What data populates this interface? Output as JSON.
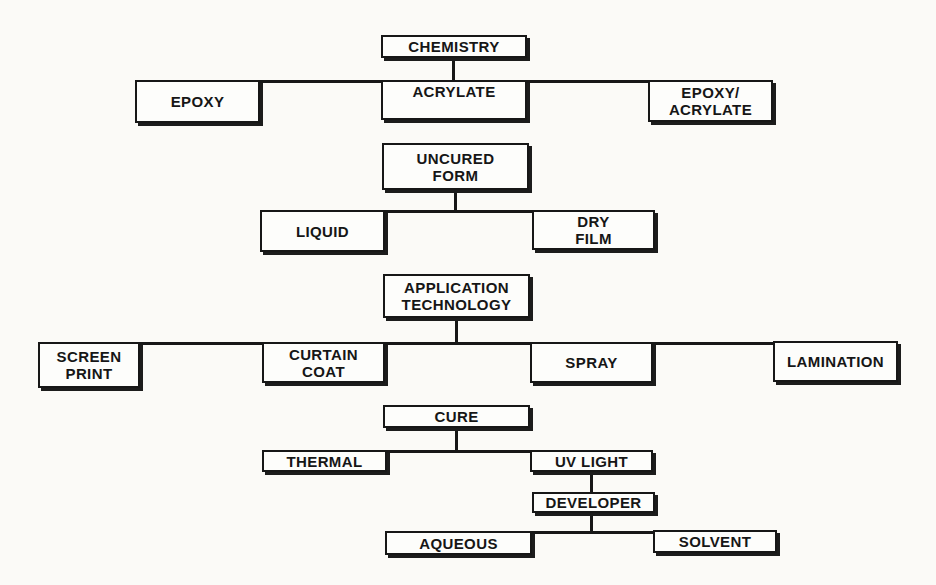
{
  "diagram": {
    "type": "tree-flowchart",
    "background_color": "#fbfaf7",
    "box_border_color": "#171717",
    "box_fill_color": "#fdfdfb",
    "line_color": "#171717",
    "nodes": [
      {
        "id": "chemistry",
        "label": "CHEMISTRY"
      },
      {
        "id": "epoxy",
        "label": "EPOXY"
      },
      {
        "id": "acrylate",
        "label": "ACRYLATE"
      },
      {
        "id": "epoxy-acrylate",
        "label": "EPOXY/\nACRYLATE"
      },
      {
        "id": "uncured-form",
        "label": "UNCURED\nFORM"
      },
      {
        "id": "liquid",
        "label": "LIQUID"
      },
      {
        "id": "dry-film",
        "label": "DRY\nFILM"
      },
      {
        "id": "application-technology",
        "label": "APPLICATION\nTECHNOLOGY"
      },
      {
        "id": "screen-print",
        "label": "SCREEN\nPRINT"
      },
      {
        "id": "curtain-coat",
        "label": "CURTAIN\nCOAT"
      },
      {
        "id": "spray",
        "label": "SPRAY"
      },
      {
        "id": "lamination",
        "label": "LAMINATION"
      },
      {
        "id": "cure",
        "label": "CURE"
      },
      {
        "id": "thermal",
        "label": "THERMAL"
      },
      {
        "id": "uv-light",
        "label": "UV LIGHT"
      },
      {
        "id": "developer",
        "label": "DEVELOPER"
      },
      {
        "id": "aqueous",
        "label": "AQUEOUS"
      },
      {
        "id": "solvent",
        "label": "SOLVENT"
      }
    ],
    "edges": [
      {
        "from": "chemistry",
        "to": [
          "epoxy",
          "acrylate",
          "epoxy-acrylate"
        ]
      },
      {
        "from": "uncured-form",
        "to": [
          "liquid",
          "dry-film"
        ]
      },
      {
        "from": "application-technology",
        "to": [
          "screen-print",
          "curtain-coat",
          "spray",
          "lamination"
        ]
      },
      {
        "from": "cure",
        "to": [
          "thermal",
          "uv-light"
        ]
      },
      {
        "from": "uv-light",
        "to": [
          "developer"
        ]
      },
      {
        "from": "developer",
        "to": [
          "aqueous",
          "solvent"
        ]
      }
    ]
  }
}
